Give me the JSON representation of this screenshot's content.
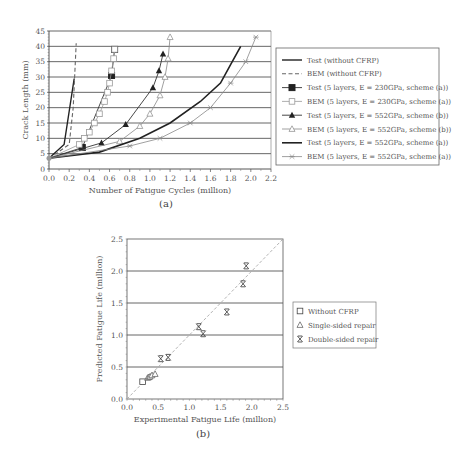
{
  "chart_data": [
    {
      "type": "line",
      "caption": "(a)",
      "title": "",
      "xlabel": "Number of Fatigue Cycles (million)",
      "ylabel": "Crack Length (mm)",
      "xlim": [
        0,
        2.2
      ],
      "ylim": [
        0,
        45
      ],
      "xticks": [
        "0.0",
        "0.2",
        "0.4",
        "0.6",
        "0.8",
        "1.0",
        "1.2",
        "1.4",
        "1.6",
        "1.8",
        "2.0",
        "2.2"
      ],
      "yticks": [
        "0",
        "5",
        "10",
        "15",
        "20",
        "25",
        "30",
        "35",
        "40",
        "45"
      ],
      "grid": "horizontal",
      "legend_position": "right",
      "series": [
        {
          "name": "Test (without CFRP)",
          "style": "solid",
          "marker": "none",
          "color": "#222222",
          "width": 1.4,
          "points": [
            [
              0,
              3.5
            ],
            [
              0.15,
              8
            ],
            [
              0.25,
              29.5
            ]
          ]
        },
        {
          "name": "BEM (without CFRP)",
          "style": "dashed",
          "marker": "none",
          "color": "#666666",
          "width": 1.1,
          "points": [
            [
              0,
              3.5
            ],
            [
              0.2,
              8
            ],
            [
              0.24,
              20
            ],
            [
              0.27,
              41
            ]
          ]
        },
        {
          "name": "Test (5 layers, E = 230GPa, scheme (a))",
          "style": "solid",
          "marker": "filled-square",
          "color": "#333333",
          "width": 0.9,
          "points": [
            [
              0,
              3.5
            ],
            [
              0.33,
              7
            ],
            [
              0.62,
              30.5
            ],
            [
              0.65,
              39
            ]
          ]
        },
        {
          "name": "BEM (5 layers, E = 230GPa, scheme (a))",
          "style": "solid",
          "marker": "open-square",
          "color": "#999999",
          "width": 0.8,
          "points": [
            [
              0,
              3.5
            ],
            [
              0.3,
              8
            ],
            [
              0.35,
              10
            ],
            [
              0.4,
              12
            ],
            [
              0.45,
              15
            ],
            [
              0.5,
              18
            ],
            [
              0.55,
              22
            ],
            [
              0.58,
              25
            ],
            [
              0.6,
              28
            ],
            [
              0.62,
              32
            ],
            [
              0.64,
              36
            ],
            [
              0.65,
              39
            ]
          ]
        },
        {
          "name": "Test (5 layers, E = 552GPa, scheme (b))",
          "style": "solid",
          "marker": "filled-triangle",
          "color": "#333333",
          "width": 0.9,
          "points": [
            [
              0,
              3.5
            ],
            [
              0.52,
              8.5
            ],
            [
              0.76,
              14.5
            ],
            [
              1.03,
              26.5
            ],
            [
              1.09,
              32
            ],
            [
              1.13,
              37.5
            ]
          ]
        },
        {
          "name": "BEM (5 layers, E = 552GPa, scheme (b))",
          "style": "solid",
          "marker": "open-triangle",
          "color": "#888888",
          "width": 0.8,
          "points": [
            [
              0,
              3.5
            ],
            [
              0.7,
              9
            ],
            [
              0.9,
              14
            ],
            [
              1.0,
              18
            ],
            [
              1.1,
              24
            ],
            [
              1.15,
              30
            ],
            [
              1.18,
              36
            ],
            [
              1.2,
              43
            ]
          ]
        },
        {
          "name": "Test (5 layers, E = 552GPa, scheme (a))",
          "style": "solid",
          "marker": "none",
          "color": "#222222",
          "width": 1.6,
          "points": [
            [
              0,
              3.5
            ],
            [
              0.5,
              5.5
            ],
            [
              0.9,
              10
            ],
            [
              1.2,
              15
            ],
            [
              1.5,
              22
            ],
            [
              1.7,
              28
            ],
            [
              1.8,
              34
            ],
            [
              1.9,
              40
            ]
          ]
        },
        {
          "name": "BEM (5 layers, E = 552GPa, scheme (a))",
          "style": "solid",
          "marker": "star",
          "color": "#888888",
          "width": 0.8,
          "points": [
            [
              0,
              3.5
            ],
            [
              0.8,
              7.5
            ],
            [
              1.1,
              10
            ],
            [
              1.4,
              15
            ],
            [
              1.6,
              20
            ],
            [
              1.8,
              28
            ],
            [
              1.95,
              35
            ],
            [
              2.05,
              43
            ]
          ]
        }
      ]
    },
    {
      "type": "scatter",
      "caption": "(b)",
      "title": "",
      "xlabel": "Experimental Fatigue Life (million)",
      "ylabel": "Predicted Fatigue Life (million)",
      "xlim": [
        0,
        2.5
      ],
      "ylim": [
        0,
        2.5
      ],
      "xticks": [
        "0.0",
        "0.5",
        "1.0",
        "1.5",
        "2.0",
        "2.5"
      ],
      "yticks": [
        "0.0",
        "0.5",
        "1.0",
        "1.5",
        "2.0",
        "2.5"
      ],
      "grid": "horizontal",
      "reference_line": "y = x (dashed)",
      "legend_position": "right",
      "series": [
        {
          "name": "Without CFRP",
          "marker": "open-square",
          "points": [
            [
              0.25,
              0.27
            ]
          ]
        },
        {
          "name": "Single-sided repair",
          "marker": "open-triangle",
          "points": [
            [
              0.33,
              0.33
            ],
            [
              0.35,
              0.34
            ],
            [
              0.37,
              0.35
            ],
            [
              0.4,
              0.37
            ],
            [
              0.45,
              0.39
            ]
          ]
        },
        {
          "name": "Double-sided repair",
          "marker": "x-star",
          "points": [
            [
              0.54,
              0.63
            ],
            [
              0.66,
              0.65
            ],
            [
              1.15,
              1.13
            ],
            [
              1.22,
              1.02
            ],
            [
              1.6,
              1.36
            ],
            [
              1.86,
              1.8
            ],
            [
              1.91,
              2.08
            ]
          ]
        }
      ]
    }
  ]
}
